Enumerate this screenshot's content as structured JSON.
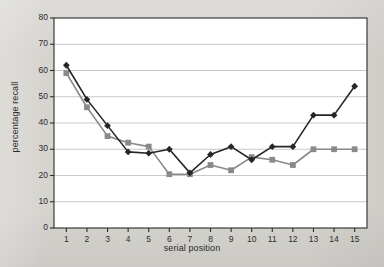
{
  "chart_data": {
    "type": "line",
    "title": "",
    "xlabel": "serial position",
    "ylabel": "percentage recall",
    "x": [
      1,
      2,
      3,
      4,
      5,
      6,
      7,
      8,
      9,
      10,
      11,
      12,
      13,
      14,
      15
    ],
    "xticklabels": [
      "1",
      "2",
      "3",
      "4",
      "5",
      "6",
      "7",
      "8",
      "9",
      "10",
      "11",
      "12",
      "13",
      "14",
      "15"
    ],
    "yticklabels": [
      "0",
      "10",
      "20",
      "30",
      "40",
      "50",
      "60",
      "70",
      "80"
    ],
    "yticks": [
      0,
      10,
      20,
      30,
      40,
      50,
      60,
      70,
      80
    ],
    "xlim": [
      0.4,
      15.6
    ],
    "ylim": [
      0,
      80
    ],
    "grid": "horizontal",
    "legend": "none",
    "series": [
      {
        "name": "series-dark",
        "marker": "diamond",
        "color": "#262626",
        "values": [
          62,
          49,
          39,
          29,
          28.5,
          30,
          21,
          28,
          31,
          26,
          31,
          31,
          43,
          43,
          54
        ]
      },
      {
        "name": "series-gray",
        "marker": "square",
        "color": "#8a8a8a",
        "values": [
          59,
          46,
          35,
          32.5,
          31,
          20.5,
          20.5,
          24,
          22,
          27,
          26,
          24,
          30,
          30,
          30
        ]
      }
    ],
    "colors": {
      "plot_background": "#ffffff",
      "page_background": "#d6d4cf",
      "gridline": "#c9c9c9",
      "axis": "#2b2b2b",
      "text": "#2c2c2c"
    }
  }
}
